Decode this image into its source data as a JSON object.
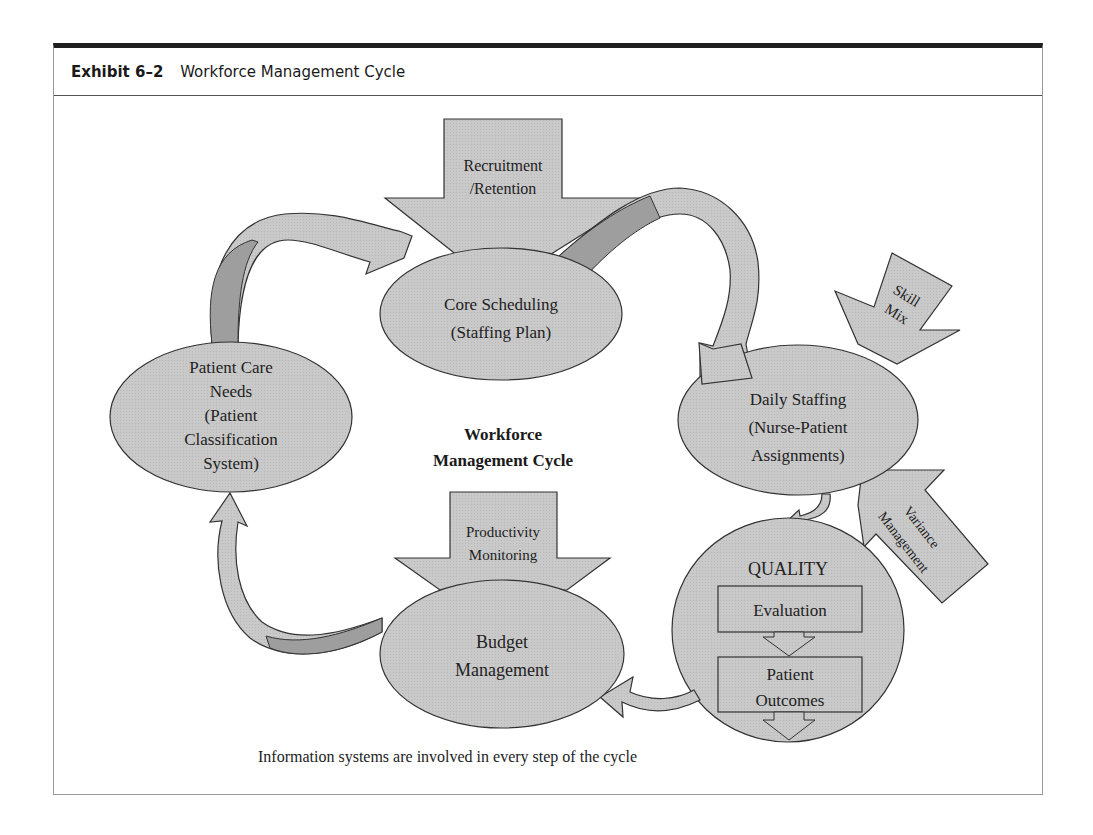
{
  "exhibit": {
    "number_label": "Exhibit 6–2",
    "title": "Workforce Management Cycle"
  },
  "diagram": {
    "center_title_line1": "Workforce",
    "center_title_line2": "Management Cycle",
    "nodes": {
      "core_scheduling": {
        "line1": "Core Scheduling",
        "line2": "(Staffing Plan)"
      },
      "daily_staffing": {
        "line1": "Daily Staffing",
        "line2": "(Nurse-Patient",
        "line3": "Assignments)"
      },
      "quality": {
        "title": "QUALITY",
        "evaluation": "Evaluation",
        "outcomes_line1": "Patient",
        "outcomes_line2": "Outcomes"
      },
      "budget_management": {
        "line1": "Budget",
        "line2": "Management"
      },
      "patient_care_needs": {
        "line1": "Patient Care",
        "line2": "Needs",
        "line3": "(Patient",
        "line4": "Classification",
        "line5": "System)"
      }
    },
    "inputs": {
      "recruitment": {
        "line1": "Recruitment",
        "line2": "/Retention"
      },
      "skill_mix": {
        "line1": "Skill",
        "line2": "Mix"
      },
      "variance": {
        "line1": "Variance",
        "line2": "Management"
      },
      "productivity": {
        "line1": "Productivity",
        "line2": "Monitoring"
      }
    },
    "caption": "Information systems are involved in every step of the cycle",
    "colors": {
      "fill": "#c8c8c8",
      "fill_dark": "#9e9e9e",
      "stroke": "#333333"
    }
  }
}
